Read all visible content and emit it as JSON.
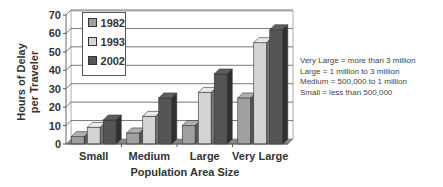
{
  "chart_data": {
    "type": "bar",
    "style": "3d-clustered",
    "title": "",
    "xlabel": "Population Area Size",
    "ylabel": "Hours of Delay per Traveler",
    "ylabel_lines": [
      "Hours of Delay",
      "per Traveler"
    ],
    "ylim": [
      0,
      70
    ],
    "yticks": [
      0,
      10,
      20,
      30,
      40,
      50,
      60,
      70
    ],
    "grid": true,
    "legend_position": "upper-left-inside",
    "categories": [
      "Small",
      "Medium",
      "Large",
      "Very Large"
    ],
    "series": [
      {
        "name": "1982",
        "color": "#a0a0a0",
        "values": [
          4,
          6,
          10,
          25
        ]
      },
      {
        "name": "1993",
        "color": "#d4d4d4",
        "values": [
          9,
          15,
          28,
          55
        ]
      },
      {
        "name": "2002",
        "color": "#555555",
        "values": [
          13,
          25,
          38,
          62
        ]
      }
    ],
    "annotations": [
      "Very Large = more than 3 million",
      "Large = 1 million to 3 million",
      "Medium = 500,000 to 1 million",
      "Small = less than 500,000"
    ]
  }
}
